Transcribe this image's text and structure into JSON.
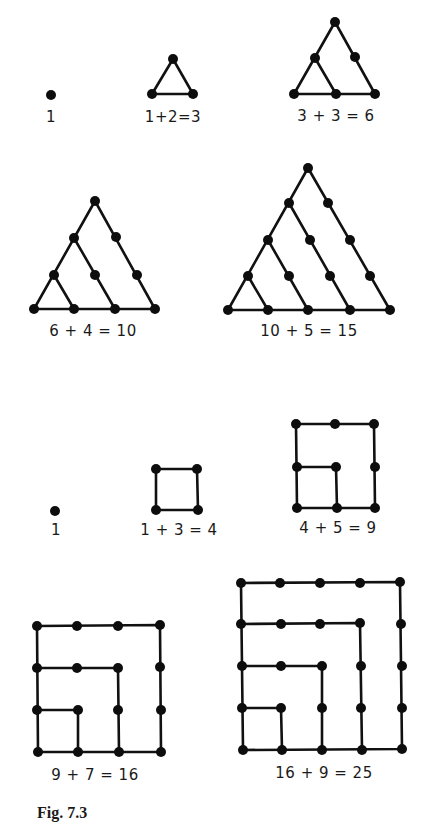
{
  "figure": {
    "caption": "Fig. 7.3",
    "style": {
      "ink_color": "#111111",
      "background": "#ffffff",
      "dot_radius": 5
    },
    "triangular_numbers": [
      {
        "id": "tri-1",
        "label": "1",
        "label_pos": [
          51,
          111
        ],
        "edges": [],
        "dots": [
          [
            51,
            95
          ]
        ]
      },
      {
        "id": "tri-3",
        "label": "1+2=3",
        "label_pos": [
          173,
          111
        ],
        "edges": [
          [
            [
              173,
              59
            ],
            [
              152,
              94
            ],
            [
              193,
              94
            ],
            [
              173,
              59
            ]
          ]
        ],
        "dots": [
          [
            173,
            59
          ],
          [
            152,
            94
          ],
          [
            193,
            94
          ]
        ]
      },
      {
        "id": "tri-6",
        "label": "3 + 3 = 6",
        "label_pos": [
          336,
          110
        ],
        "edges": [
          [
            [
              335,
              22
            ],
            [
              294,
              94
            ],
            [
              375,
              94
            ],
            [
              335,
              22
            ]
          ],
          [
            [
              315,
              58
            ],
            [
              336,
              94
            ]
          ]
        ],
        "dots": [
          [
            335,
            22
          ],
          [
            315,
            58
          ],
          [
            355,
            57
          ],
          [
            294,
            94
          ],
          [
            336,
            94
          ],
          [
            375,
            94
          ]
        ]
      },
      {
        "id": "tri-10",
        "label": "6 + 4 = 10",
        "label_pos": [
          93,
          325
        ],
        "edges": [
          [
            [
              95,
              201
            ],
            [
              34,
              309
            ],
            [
              155,
              309
            ],
            [
              95,
              201
            ]
          ],
          [
            [
              74,
              238
            ],
            [
              115,
              309
            ]
          ],
          [
            [
              54,
              275
            ],
            [
              74,
              309
            ]
          ]
        ],
        "dots": [
          [
            95,
            201
          ],
          [
            74,
            238
          ],
          [
            116,
            237
          ],
          [
            54,
            275
          ],
          [
            95,
            275
          ],
          [
            137,
            275
          ],
          [
            34,
            309
          ],
          [
            74,
            309
          ],
          [
            115,
            309
          ],
          [
            155,
            309
          ]
        ]
      },
      {
        "id": "tri-15",
        "label": "10 + 5 = 15",
        "label_pos": [
          309,
          325
        ],
        "edges": [
          [
            [
              308,
              168
            ],
            [
              228,
              310
            ],
            [
              390,
              310
            ],
            [
              308,
              168
            ]
          ],
          [
            [
              289,
              203
            ],
            [
              350,
              310
            ]
          ],
          [
            [
              268,
              240
            ],
            [
              308,
              310
            ]
          ],
          [
            [
              248,
              276
            ],
            [
              268,
              310
            ]
          ]
        ],
        "dots": [
          [
            308,
            168
          ],
          [
            289,
            203
          ],
          [
            328,
            203
          ],
          [
            268,
            240
          ],
          [
            310,
            240
          ],
          [
            350,
            240
          ],
          [
            248,
            276
          ],
          [
            289,
            276
          ],
          [
            330,
            276
          ],
          [
            370,
            276
          ],
          [
            228,
            310
          ],
          [
            268,
            310
          ],
          [
            308,
            310
          ],
          [
            350,
            310
          ],
          [
            390,
            310
          ]
        ]
      }
    ],
    "square_numbers": [
      {
        "id": "sq-1",
        "label": "1",
        "label_pos": [
          56,
          524
        ],
        "edges": [],
        "dots": [
          [
            55,
            511
          ]
        ]
      },
      {
        "id": "sq-4",
        "label": "1 + 3 = 4",
        "label_pos": [
          179,
          524
        ],
        "edges": [
          [
            [
              156,
              469
            ],
            [
              197,
              469
            ],
            [
              198,
              510
            ],
            [
              156,
              510
            ],
            [
              156,
              469
            ]
          ]
        ],
        "dots": [
          [
            156,
            469
          ],
          [
            197,
            469
          ],
          [
            156,
            510
          ],
          [
            198,
            510
          ]
        ]
      },
      {
        "id": "sq-9",
        "label": "4 + 5 = 9",
        "label_pos": [
          338,
          522
        ],
        "edges": [
          [
            [
              296,
              424
            ],
            [
              374,
              424
            ],
            [
              375,
              508
            ],
            [
              297,
              508
            ],
            [
              296,
              424
            ]
          ],
          [
            [
              297,
              467
            ],
            [
              336,
              467
            ],
            [
              337,
              508
            ]
          ]
        ],
        "dots": [
          [
            296,
            424
          ],
          [
            335,
            424
          ],
          [
            374,
            424
          ],
          [
            297,
            467
          ],
          [
            336,
            467
          ],
          [
            375,
            467
          ],
          [
            297,
            508
          ],
          [
            337,
            508
          ],
          [
            375,
            508
          ]
        ]
      },
      {
        "id": "sq-16",
        "label": "9 + 7 = 16",
        "label_pos": [
          95,
          769
        ],
        "edges": [
          [
            [
              37,
              626
            ],
            [
              160,
              625
            ],
            [
              161,
              752
            ],
            [
              38,
              752
            ],
            [
              37,
              626
            ]
          ],
          [
            [
              37,
              668
            ],
            [
              118,
              668
            ],
            [
              119,
              752
            ]
          ],
          [
            [
              37,
              710
            ],
            [
              78,
              710
            ],
            [
              78,
              752
            ]
          ]
        ],
        "dots": [
          [
            37,
            626
          ],
          [
            77,
            626
          ],
          [
            118,
            626
          ],
          [
            160,
            625
          ],
          [
            37,
            668
          ],
          [
            77,
            668
          ],
          [
            118,
            668
          ],
          [
            160,
            667
          ],
          [
            37,
            710
          ],
          [
            78,
            710
          ],
          [
            118,
            710
          ],
          [
            161,
            710
          ],
          [
            38,
            752
          ],
          [
            78,
            752
          ],
          [
            119,
            752
          ],
          [
            161,
            752
          ]
        ]
      },
      {
        "id": "sq-25",
        "label": "16 + 9 = 25",
        "label_pos": [
          324,
          767
        ],
        "edges": [
          [
            [
              241,
              583
            ],
            [
              400,
              582
            ],
            [
              402,
              749
            ],
            [
              243,
              750
            ],
            [
              241,
              583
            ]
          ],
          [
            [
              241,
              624
            ],
            [
              360,
              623
            ],
            [
              362,
              750
            ]
          ],
          [
            [
              242,
              666
            ],
            [
              322,
              666
            ],
            [
              322,
              750
            ]
          ],
          [
            [
              242,
              708
            ],
            [
              281,
              708
            ],
            [
              282,
              750
            ]
          ]
        ],
        "dots": [
          [
            241,
            583
          ],
          [
            280,
            583
          ],
          [
            320,
            583
          ],
          [
            360,
            583
          ],
          [
            400,
            582
          ],
          [
            241,
            624
          ],
          [
            281,
            624
          ],
          [
            320,
            624
          ],
          [
            360,
            623
          ],
          [
            401,
            624
          ],
          [
            242,
            666
          ],
          [
            281,
            666
          ],
          [
            322,
            666
          ],
          [
            361,
            666
          ],
          [
            402,
            666
          ],
          [
            242,
            708
          ],
          [
            281,
            708
          ],
          [
            322,
            708
          ],
          [
            361,
            708
          ],
          [
            402,
            708
          ],
          [
            243,
            750
          ],
          [
            282,
            750
          ],
          [
            322,
            750
          ],
          [
            362,
            750
          ],
          [
            402,
            749
          ]
        ]
      }
    ]
  }
}
